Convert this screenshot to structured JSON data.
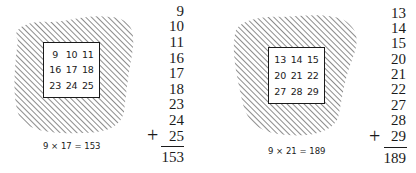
{
  "figures": [
    {
      "grid": [
        [
          "9",
          "10",
          "11"
        ],
        [
          "16",
          "17",
          "18"
        ],
        [
          "23",
          "24",
          "25"
        ]
      ],
      "addends": [
        "9",
        "10",
        "11",
        "16",
        "17",
        "18",
        "23",
        "24",
        "25"
      ],
      "operator": "+",
      "sum": "153",
      "caption": "9 × 17 = 153"
    },
    {
      "grid": [
        [
          "13",
          "14",
          "15"
        ],
        [
          "20",
          "21",
          "22"
        ],
        [
          "27",
          "28",
          "29"
        ]
      ],
      "addends": [
        "13",
        "14",
        "15",
        "20",
        "21",
        "22",
        "27",
        "28",
        "29"
      ],
      "operator": "+",
      "sum": "189",
      "caption": "9 × 21 = 189"
    }
  ],
  "colors": {
    "ink": "#1a1a1a",
    "background": "#ffffff"
  }
}
